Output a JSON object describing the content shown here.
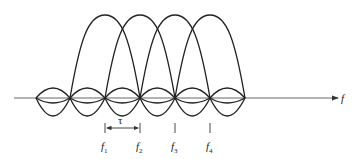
{
  "diagram": {
    "type": "ofdm-subcarrier-spectrum",
    "axis_label": "f",
    "spacing_label": "τ",
    "subcarriers": [
      {
        "label": "f",
        "sub": "1"
      },
      {
        "label": "f",
        "sub": "2"
      },
      {
        "label": "f",
        "sub": "3"
      },
      {
        "label": "f",
        "sub": "4"
      }
    ],
    "colors": {
      "line": "#222222",
      "axis": "#555555",
      "background": "#ffffff"
    }
  }
}
